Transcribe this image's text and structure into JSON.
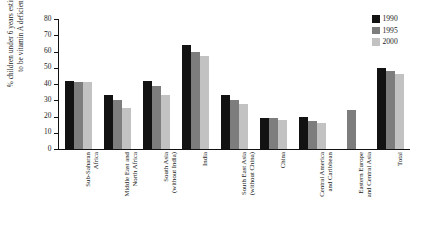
{
  "chart_data": {
    "type": "bar",
    "title": "",
    "xlabel": "",
    "ylabel": "% children under 6 years estimated\nto be vitamin A deficient",
    "ylim": [
      0,
      80
    ],
    "yticks": [
      0,
      10,
      20,
      30,
      40,
      50,
      60,
      70,
      80
    ],
    "grid": false,
    "legend_position": "top-right",
    "categories": [
      "Sub-Saharan\nAfrica",
      "Middle East and\nNorth Africa",
      "South Asia\n(without India)",
      "India",
      "South East Asia\n(without China)",
      "China",
      "Central America\nand Caribbean",
      "Eastern Europe\nand Central Asia",
      "Total"
    ],
    "series": [
      {
        "name": "1990",
        "color": "#121212",
        "values": [
          42,
          33,
          42,
          64,
          33,
          19,
          20,
          null,
          50
        ]
      },
      {
        "name": "1995",
        "color": "#7d7d7d",
        "values": [
          41,
          30,
          38.5,
          60,
          30,
          19,
          17.5,
          24,
          48
        ]
      },
      {
        "name": "2000",
        "color": "#c2c2c2",
        "values": [
          41,
          25.5,
          33,
          57,
          28,
          18,
          16,
          null,
          46
        ]
      }
    ]
  },
  "legend": {
    "items": [
      {
        "label": "1990",
        "color": "#121212"
      },
      {
        "label": "1995",
        "color": "#7d7d7d"
      },
      {
        "label": "2000",
        "color": "#c2c2c2"
      }
    ]
  }
}
